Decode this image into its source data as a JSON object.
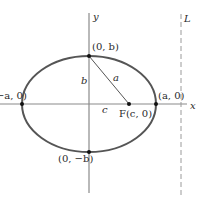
{
  "diagram": {
    "type": "ellipse-with-focus-and-directrix",
    "axes": {
      "x_label": "x",
      "y_label": "y"
    },
    "directrix_label": "L",
    "points": {
      "left_vertex": "(−a, 0)",
      "right_vertex": "(a, 0)",
      "top_vertex": "(0, b)",
      "bottom_vertex": "(0, −b)",
      "focus": "F(c, 0)"
    },
    "segment_labels": {
      "semi_minor": "b",
      "hypotenuse": "a",
      "focal_distance": "c"
    },
    "colors": {
      "curve": "#555555",
      "axes": "#888888",
      "text": "#2a2a2a",
      "points": "#111111"
    }
  }
}
